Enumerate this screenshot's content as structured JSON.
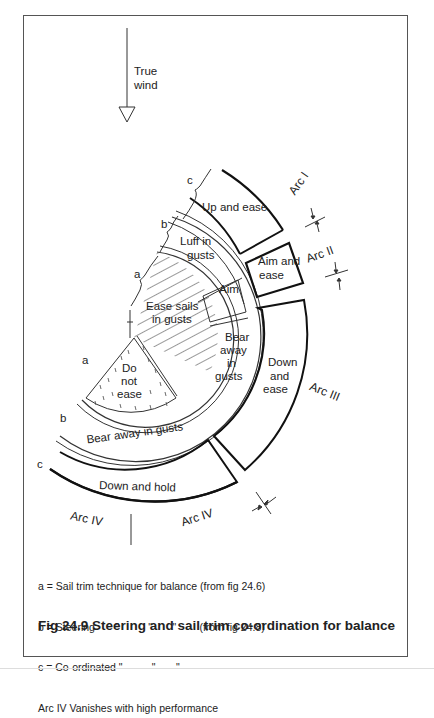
{
  "wind": {
    "label_line1": "True",
    "label_line2": "wind"
  },
  "zones": {
    "up_and_ease": "Up and ease",
    "luff_line1": "Luff in",
    "luff_line2": "gusts",
    "aim": "Aim",
    "aim_and_ease_line1": "Aim and",
    "aim_and_ease_line2": "ease",
    "ease_sails_line1": "Ease sails",
    "ease_sails_line2": "in gusts",
    "bear_away_line1": "Bear",
    "bear_away_line2": "away",
    "bear_away_line3": "in",
    "bear_away_line4": "gusts",
    "do_not_line1": "Do",
    "do_not_line2": "not",
    "do_not_line3": "ease",
    "down_and_ease_line1": "Down",
    "down_and_ease_line2": "and",
    "down_and_ease_line3": "ease",
    "bear_away_in_gusts": "Bear away in gusts",
    "down_and_hold": "Down and hold"
  },
  "arcs": {
    "arc1": "Arc I",
    "arc2": "Arc II",
    "arc3": "Arc III",
    "arc4_left": "Arc IV",
    "arc4_right": "Arc IV"
  },
  "ring_letters": {
    "a_upper": "a",
    "b_upper": "b",
    "c_upper": "c",
    "a_lower": "a",
    "b_lower": "b",
    "c_lower": "c"
  },
  "legend": {
    "line_a": "a = Sail trim technique for balance (from fig 24.6)",
    "line_b": "b = Steering       \"          \"       \"        (from fig 24.8)",
    "line_c": "c = Co-ordinated \"          \"       \"",
    "line_arc": "Arc IV Vanishes with high performance"
  },
  "caption": "Fig 24.9 Steering and sail trim co-ordination for balance"
}
